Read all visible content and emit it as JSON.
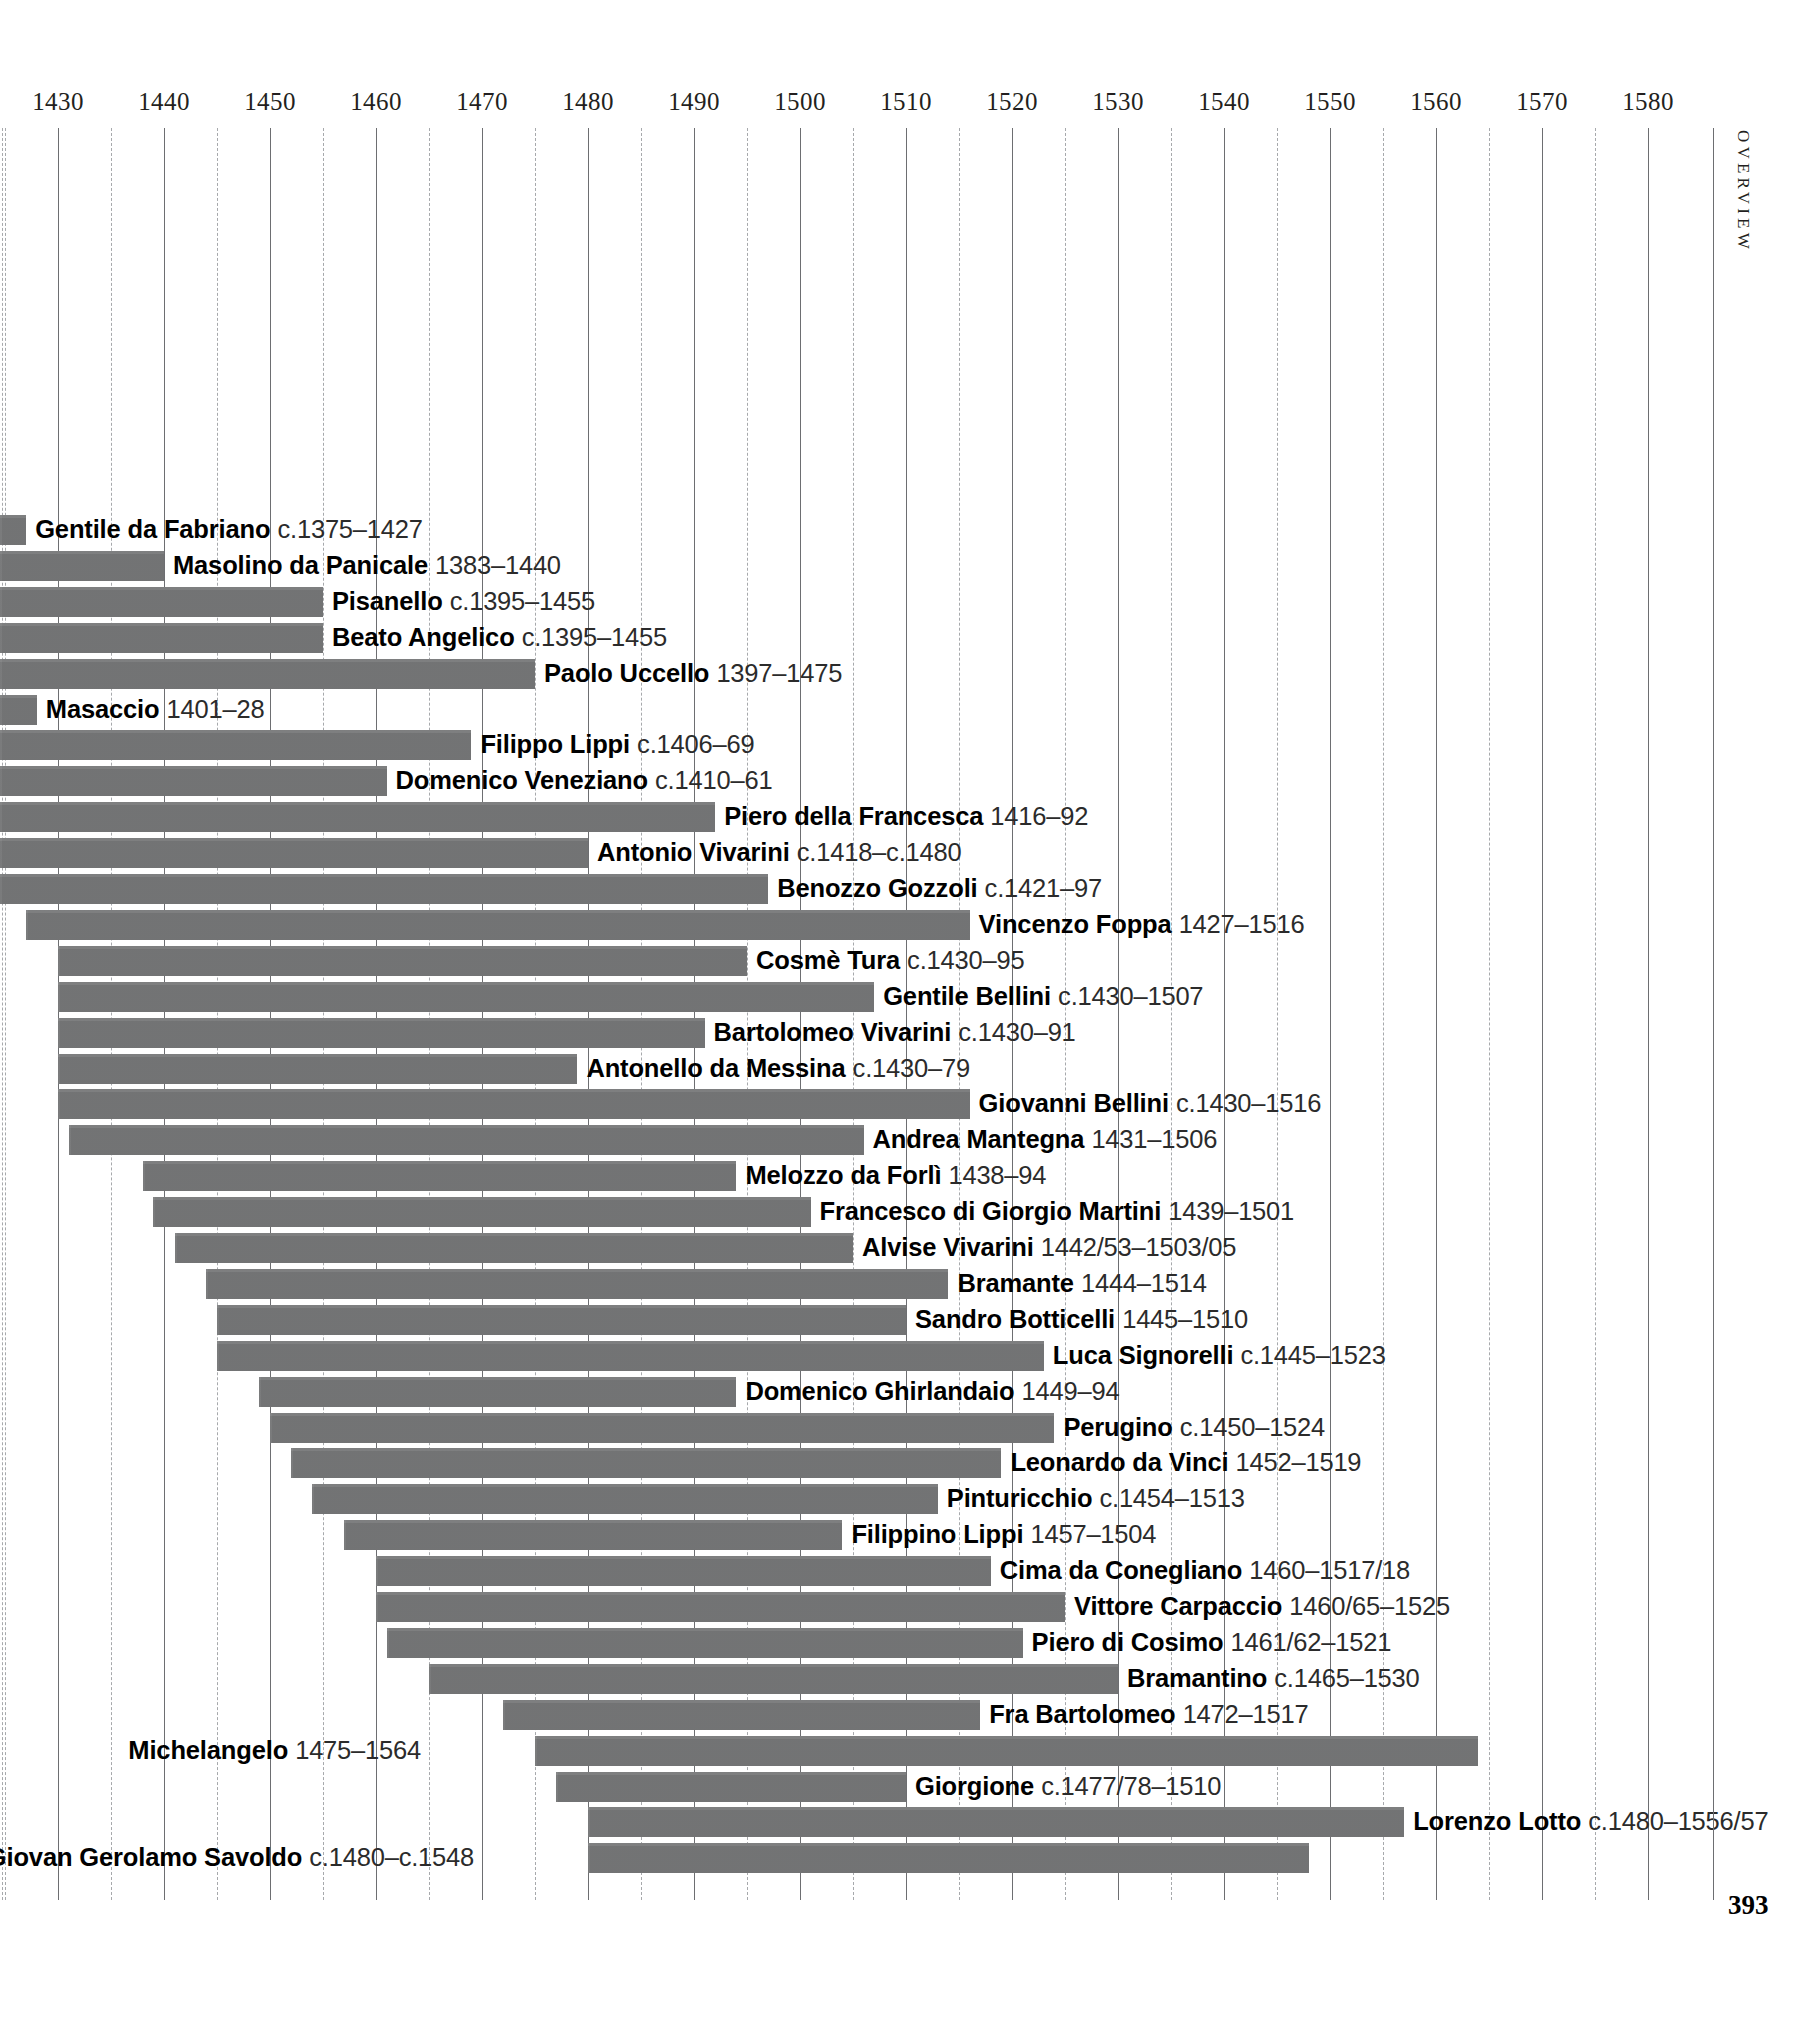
{
  "page": {
    "folio": "393",
    "section_tab": "OVERVIEW"
  },
  "chart_data": {
    "type": "bar",
    "orientation": "horizontal",
    "subtype": "timeline-gantt",
    "title": "",
    "xlabel": "",
    "ylabel": "",
    "xlim": [
      1375,
      1585
    ],
    "axis_visible_range": [
      1430,
      1580
    ],
    "grid": "vertical major every 10 years (solid), minor every 5 years (dashed)",
    "legend": "none",
    "bar_color": "#777879",
    "tick_labels": [
      "1430",
      "1440",
      "1450",
      "1460",
      "1470",
      "1480",
      "1490",
      "1500",
      "1510",
      "1520",
      "1530",
      "1540",
      "1550",
      "1560",
      "1570",
      "1580"
    ],
    "tick_values": [
      1430,
      1440,
      1450,
      1460,
      1470,
      1480,
      1490,
      1500,
      1510,
      1520,
      1530,
      1540,
      1550,
      1560,
      1570,
      1580
    ],
    "minor_tick_values": [
      1425,
      1435,
      1445,
      1455,
      1465,
      1475,
      1485,
      1495,
      1505,
      1515,
      1525,
      1535,
      1545,
      1555,
      1565,
      1575
    ],
    "note": "Bars beginning before 1425 are clipped at the left edge of the page.",
    "rows": [
      {
        "name": "Gentile da Fabriano",
        "dates": "c.1375–1427",
        "start": 1375,
        "end": 1427,
        "label_side": "right"
      },
      {
        "name": "Masolino da Panicale",
        "dates": "1383–1440",
        "start": 1383,
        "end": 1440,
        "label_side": "right"
      },
      {
        "name": "Pisanello",
        "dates": "c.1395–1455",
        "start": 1395,
        "end": 1455,
        "label_side": "right"
      },
      {
        "name": "Beato Angelico",
        "dates": "c.1395–1455",
        "start": 1395,
        "end": 1455,
        "label_side": "right"
      },
      {
        "name": "Paolo Uccello",
        "dates": "1397–1475",
        "start": 1397,
        "end": 1475,
        "label_side": "right"
      },
      {
        "name": "Masaccio",
        "dates": "1401–28",
        "start": 1401,
        "end": 1428,
        "label_side": "right"
      },
      {
        "name": "Filippo Lippi",
        "dates": "c.1406–69",
        "start": 1406,
        "end": 1469,
        "label_side": "right"
      },
      {
        "name": "Domenico Veneziano",
        "dates": "c.1410–61",
        "start": 1410,
        "end": 1461,
        "label_side": "right"
      },
      {
        "name": "Piero della Francesca",
        "dates": "1416–92",
        "start": 1416,
        "end": 1492,
        "label_side": "right"
      },
      {
        "name": "Antonio Vivarini",
        "dates": "c.1418–c.1480",
        "start": 1418,
        "end": 1480,
        "label_side": "right"
      },
      {
        "name": "Benozzo Gozzoli",
        "dates": "c.1421–97",
        "start": 1421,
        "end": 1497,
        "label_side": "right"
      },
      {
        "name": "Vincenzo Foppa",
        "dates": "1427–1516",
        "start": 1427,
        "end": 1516,
        "label_side": "right"
      },
      {
        "name": "Cosmè Tura",
        "dates": "c.1430–95",
        "start": 1430,
        "end": 1495,
        "label_side": "right"
      },
      {
        "name": "Gentile Bellini",
        "dates": "c.1430–1507",
        "start": 1430,
        "end": 1507,
        "label_side": "right"
      },
      {
        "name": "Bartolomeo Vivarini",
        "dates": "c.1430–91",
        "start": 1430,
        "end": 1491,
        "label_side": "right"
      },
      {
        "name": "Antonello da Messina",
        "dates": "c.1430–79",
        "start": 1430,
        "end": 1479,
        "label_side": "right"
      },
      {
        "name": "Giovanni Bellini",
        "dates": "c.1430–1516",
        "start": 1430,
        "end": 1516,
        "label_side": "right"
      },
      {
        "name": "Andrea Mantegna",
        "dates": "1431–1506",
        "start": 1431,
        "end": 1506,
        "label_side": "right"
      },
      {
        "name": "Melozzo da Forlì",
        "dates": "1438–94",
        "start": 1438,
        "end": 1494,
        "label_side": "right"
      },
      {
        "name": "Francesco di Giorgio Martini",
        "dates": "1439–1501",
        "start": 1439,
        "end": 1501,
        "label_side": "right"
      },
      {
        "name": "Alvise Vivarini",
        "dates": "1442/53–1503/05",
        "start": 1441,
        "end": 1505,
        "label_side": "right"
      },
      {
        "name": "Bramante",
        "dates": "1444–1514",
        "start": 1444,
        "end": 1514,
        "label_side": "right"
      },
      {
        "name": "Sandro Botticelli",
        "dates": "1445–1510",
        "start": 1445,
        "end": 1510,
        "label_side": "right"
      },
      {
        "name": "Luca Signorelli",
        "dates": "c.1445–1523",
        "start": 1445,
        "end": 1523,
        "label_side": "right"
      },
      {
        "name": "Domenico Ghirlandaio",
        "dates": "1449–94",
        "start": 1449,
        "end": 1494,
        "label_side": "right"
      },
      {
        "name": "Perugino",
        "dates": "c.1450–1524",
        "start": 1450,
        "end": 1524,
        "label_side": "right"
      },
      {
        "name": "Leonardo da Vinci",
        "dates": "1452–1519",
        "start": 1452,
        "end": 1519,
        "label_side": "right"
      },
      {
        "name": "Pinturicchio",
        "dates": "c.1454–1513",
        "start": 1454,
        "end": 1513,
        "label_side": "right"
      },
      {
        "name": "Filippino Lippi",
        "dates": "1457–1504",
        "start": 1457,
        "end": 1504,
        "label_side": "right"
      },
      {
        "name": "Cima da Conegliano",
        "dates": "1460–1517/18",
        "start": 1460,
        "end": 1518,
        "label_side": "right"
      },
      {
        "name": "Vittore Carpaccio",
        "dates": "1460/65–1525",
        "start": 1460,
        "end": 1525,
        "label_side": "right"
      },
      {
        "name": "Piero di Cosimo",
        "dates": "1461/62–1521",
        "start": 1461,
        "end": 1521,
        "label_side": "right"
      },
      {
        "name": "Bramantino",
        "dates": "c.1465–1530",
        "start": 1465,
        "end": 1530,
        "label_side": "right"
      },
      {
        "name": "Fra Bartolomeo",
        "dates": "1472–1517",
        "start": 1472,
        "end": 1517,
        "label_side": "right"
      },
      {
        "name": "Michelangelo",
        "dates": "1475–1564",
        "start": 1475,
        "end": 1564,
        "label_side": "left"
      },
      {
        "name": "Giorgione",
        "dates": "c.1477/78–1510",
        "start": 1477,
        "end": 1510,
        "label_side": "right"
      },
      {
        "name": "Lorenzo Lotto",
        "dates": "c.1480–1556/57",
        "start": 1480,
        "end": 1557,
        "label_side": "right"
      },
      {
        "name": "Giovan Gerolamo Savoldo",
        "dates": "c.1480–c.1548",
        "start": 1480,
        "end": 1548,
        "label_side": "left"
      }
    ]
  }
}
